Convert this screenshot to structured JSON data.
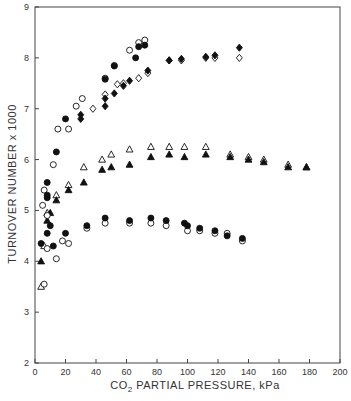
{
  "chart_data": {
    "type": "scatter",
    "title": "",
    "xlabel": "CO2 PARTIAL PRESSURE, kPa",
    "xlabel_parts": {
      "pre": "CO",
      "sub": "2",
      "post": " PARTIAL PRESSURE, kPa"
    },
    "ylabel": "TURNOVER NUMBER x 1000",
    "xlim": [
      0,
      200
    ],
    "ylim": [
      2,
      9
    ],
    "xticks": [
      0,
      20,
      40,
      60,
      80,
      100,
      120,
      140,
      160,
      180,
      200
    ],
    "yticks": [
      2,
      3,
      4,
      5,
      6,
      7,
      8,
      9
    ],
    "grid": false,
    "legend": "none",
    "series": [
      {
        "name": "open-circle-upper",
        "marker": "circle",
        "filled": false,
        "points": [
          [
            5,
            5.1
          ],
          [
            6,
            5.4
          ],
          [
            12,
            5.9
          ],
          [
            15,
            6.6
          ],
          [
            22,
            6.6
          ],
          [
            27,
            7.05
          ],
          [
            31,
            7.2
          ],
          [
            46,
            7.6
          ],
          [
            52,
            7.85
          ],
          [
            62,
            8.15
          ],
          [
            68,
            8.3
          ],
          [
            72,
            8.35
          ]
        ]
      },
      {
        "name": "filled-circle-upper",
        "marker": "circle",
        "filled": true,
        "points": [
          [
            14,
            6.15
          ],
          [
            20,
            6.8
          ],
          [
            46,
            7.58
          ],
          [
            52,
            7.84
          ],
          [
            66,
            8.0
          ],
          [
            68,
            8.22
          ],
          [
            72,
            8.25
          ]
        ]
      },
      {
        "name": "open-diamond-upper",
        "marker": "diamond",
        "filled": false,
        "points": [
          [
            38,
            7.0
          ],
          [
            46,
            7.28
          ],
          [
            54,
            7.48
          ],
          [
            58,
            7.5
          ],
          [
            68,
            7.6
          ],
          [
            74,
            7.7
          ],
          [
            88,
            7.95
          ],
          [
            96,
            7.95
          ],
          [
            112,
            8.0
          ],
          [
            118,
            8.0
          ],
          [
            134,
            8.0
          ]
        ]
      },
      {
        "name": "filled-diamond-upper",
        "marker": "diamond",
        "filled": true,
        "points": [
          [
            30,
            6.8
          ],
          [
            30,
            6.88
          ],
          [
            46,
            7.05
          ],
          [
            46,
            7.2
          ],
          [
            52,
            7.3
          ],
          [
            58,
            7.45
          ],
          [
            62,
            7.55
          ],
          [
            74,
            7.75
          ],
          [
            88,
            7.95
          ],
          [
            96,
            7.98
          ],
          [
            112,
            8.02
          ],
          [
            118,
            8.05
          ],
          [
            134,
            8.2
          ]
        ]
      },
      {
        "name": "open-triangle-middle",
        "marker": "triangle",
        "filled": false,
        "points": [
          [
            4,
            3.5
          ],
          [
            6,
            4.3
          ],
          [
            8,
            4.95
          ],
          [
            14,
            5.3
          ],
          [
            22,
            5.5
          ],
          [
            32,
            5.85
          ],
          [
            44,
            6.0
          ],
          [
            50,
            6.1
          ],
          [
            62,
            6.2
          ],
          [
            76,
            6.25
          ],
          [
            88,
            6.25
          ],
          [
            98,
            6.25
          ],
          [
            112,
            6.25
          ],
          [
            128,
            6.1
          ],
          [
            140,
            6.05
          ],
          [
            150,
            6.0
          ],
          [
            166,
            5.9
          ],
          [
            178,
            5.85
          ]
        ]
      },
      {
        "name": "filled-triangle-middle",
        "marker": "triangle",
        "filled": true,
        "points": [
          [
            4,
            4.0
          ],
          [
            8,
            4.8
          ],
          [
            10,
            4.95
          ],
          [
            14,
            5.2
          ],
          [
            22,
            5.4
          ],
          [
            32,
            5.55
          ],
          [
            44,
            5.8
          ],
          [
            50,
            5.85
          ],
          [
            62,
            5.9
          ],
          [
            76,
            6.05
          ],
          [
            88,
            6.1
          ],
          [
            98,
            6.05
          ],
          [
            112,
            6.1
          ],
          [
            128,
            6.05
          ],
          [
            140,
            6.0
          ],
          [
            150,
            5.95
          ],
          [
            166,
            5.85
          ],
          [
            178,
            5.85
          ]
        ]
      },
      {
        "name": "open-circle-lower",
        "marker": "circle",
        "filled": false,
        "points": [
          [
            6,
            3.55
          ],
          [
            8,
            4.25
          ],
          [
            8,
            4.9
          ],
          [
            14,
            4.05
          ],
          [
            18,
            4.4
          ],
          [
            22,
            4.35
          ],
          [
            34,
            4.65
          ],
          [
            46,
            4.75
          ],
          [
            62,
            4.75
          ],
          [
            76,
            4.75
          ],
          [
            86,
            4.7
          ],
          [
            100,
            4.6
          ],
          [
            108,
            4.6
          ],
          [
            118,
            4.55
          ],
          [
            126,
            4.55
          ],
          [
            136,
            4.4
          ]
        ]
      },
      {
        "name": "filled-circle-lower",
        "marker": "circle",
        "filled": true,
        "points": [
          [
            4,
            4.35
          ],
          [
            8,
            4.55
          ],
          [
            8,
            5.25
          ],
          [
            8,
            5.3
          ],
          [
            8,
            5.55
          ],
          [
            10,
            4.7
          ],
          [
            12,
            4.3
          ],
          [
            20,
            4.55
          ],
          [
            34,
            4.7
          ],
          [
            46,
            4.85
          ],
          [
            62,
            4.8
          ],
          [
            76,
            4.85
          ],
          [
            86,
            4.8
          ],
          [
            98,
            4.75
          ],
          [
            100,
            4.7
          ],
          [
            108,
            4.65
          ],
          [
            118,
            4.6
          ],
          [
            126,
            4.5
          ],
          [
            136,
            4.45
          ]
        ]
      }
    ]
  }
}
